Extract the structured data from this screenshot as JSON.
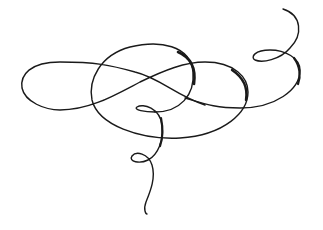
{
  "image": {
    "description": "Decorative calligraphic swirl flourish",
    "background": "#ffffff",
    "stroke_color": "#1a1a1a"
  }
}
